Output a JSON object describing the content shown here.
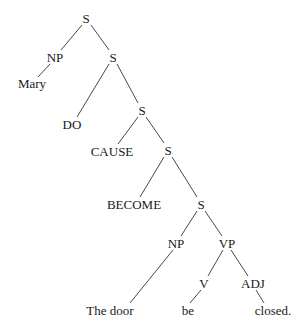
{
  "diagram": {
    "type": "syntax-tree",
    "nodes": [
      {
        "id": "s1",
        "label": "S",
        "x": 86,
        "y": 18
      },
      {
        "id": "np1",
        "label": "NP",
        "x": 55,
        "y": 57
      },
      {
        "id": "mary",
        "label": "Mary",
        "x": 32,
        "y": 83
      },
      {
        "id": "s2",
        "label": "S",
        "x": 113,
        "y": 57
      },
      {
        "id": "do",
        "label": "DO",
        "x": 72,
        "y": 124
      },
      {
        "id": "s3",
        "label": "S",
        "x": 142,
        "y": 110
      },
      {
        "id": "cause",
        "label": "CAUSE",
        "x": 112,
        "y": 151
      },
      {
        "id": "s4",
        "label": "S",
        "x": 168,
        "y": 150
      },
      {
        "id": "become",
        "label": "BECOME",
        "x": 134,
        "y": 204
      },
      {
        "id": "s5",
        "label": "S",
        "x": 201,
        "y": 204
      },
      {
        "id": "np2",
        "label": "NP",
        "x": 176,
        "y": 243
      },
      {
        "id": "thedoor",
        "label": "The door",
        "x": 110,
        "y": 310
      },
      {
        "id": "vp",
        "label": "VP",
        "x": 227,
        "y": 243
      },
      {
        "id": "v",
        "label": "V",
        "x": 204,
        "y": 283
      },
      {
        "id": "be",
        "label": "be",
        "x": 188,
        "y": 310
      },
      {
        "id": "adj",
        "label": "ADJ",
        "x": 253,
        "y": 283
      },
      {
        "id": "closed",
        "label": "closed.",
        "x": 273,
        "y": 310
      }
    ],
    "edges": [
      {
        "x1": 82,
        "y1": 25,
        "x2": 61,
        "y2": 50
      },
      {
        "x1": 91,
        "y1": 25,
        "x2": 109,
        "y2": 50
      },
      {
        "x1": 50,
        "y1": 64,
        "x2": 38,
        "y2": 77
      },
      {
        "x1": 109,
        "y1": 64,
        "x2": 77,
        "y2": 117
      },
      {
        "x1": 117,
        "y1": 64,
        "x2": 138,
        "y2": 103
      },
      {
        "x1": 138,
        "y1": 117,
        "x2": 118,
        "y2": 144
      },
      {
        "x1": 146,
        "y1": 117,
        "x2": 164,
        "y2": 143
      },
      {
        "x1": 164,
        "y1": 157,
        "x2": 140,
        "y2": 197
      },
      {
        "x1": 172,
        "y1": 157,
        "x2": 197,
        "y2": 197
      },
      {
        "x1": 197,
        "y1": 211,
        "x2": 181,
        "y2": 236
      },
      {
        "x1": 205,
        "y1": 211,
        "x2": 222,
        "y2": 236
      },
      {
        "x1": 173,
        "y1": 250,
        "x2": 130,
        "y2": 303
      },
      {
        "x1": 223,
        "y1": 250,
        "x2": 208,
        "y2": 276
      },
      {
        "x1": 231,
        "y1": 250,
        "x2": 248,
        "y2": 276
      },
      {
        "x1": 201,
        "y1": 290,
        "x2": 190,
        "y2": 303
      },
      {
        "x1": 256,
        "y1": 290,
        "x2": 264,
        "y2": 303
      }
    ]
  },
  "labels": {
    "s1": "S",
    "np1": "NP",
    "mary": "Mary",
    "s2": "S",
    "do": "DO",
    "s3": "S",
    "cause": "CAUSE",
    "s4": "S",
    "become": "BECOME",
    "s5": "S",
    "np2": "NP",
    "thedoor": "The door",
    "vp": "VP",
    "v": "V",
    "be": "be",
    "adj": "ADJ",
    "closed": "closed."
  }
}
